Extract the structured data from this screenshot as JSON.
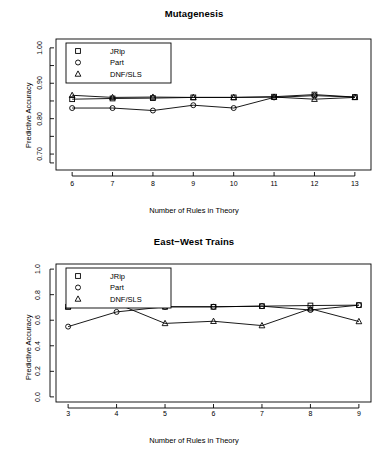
{
  "figure": {
    "axis_label_y": "Predictive Accuracy",
    "axis_label_x": "Number of Rules in Theory",
    "legend": [
      {
        "label": "JRip",
        "marker": "square"
      },
      {
        "label": "Part",
        "marker": "circle"
      },
      {
        "label": "DNF/SLS",
        "marker": "triangle"
      }
    ]
  },
  "chart_data": [
    {
      "type": "line",
      "title": "Mutagenesis",
      "xlabel": "Number of Rules in Theory",
      "ylabel": "Predictive Accuracy",
      "x": [
        6,
        7,
        8,
        9,
        10,
        11,
        12,
        13
      ],
      "xlim": [
        5.6,
        13.4
      ],
      "ylim": [
        0.655,
        1.025
      ],
      "xticks": [
        "6",
        "7",
        "8",
        "9",
        "10",
        "11",
        "12",
        "13"
      ],
      "yticks": [
        "1.00",
        "0.90",
        "0.80",
        "0.70"
      ],
      "ytick_values": [
        1.0,
        0.9,
        0.8,
        0.7
      ],
      "minor_ytick_values": [
        0.95,
        0.85,
        0.75,
        0.675
      ],
      "grid": false,
      "legend_position": "top-left",
      "series": [
        {
          "name": "JRip",
          "marker": "square",
          "values": [
            0.855,
            0.857,
            0.858,
            0.86,
            0.86,
            0.862,
            0.868,
            0.861
          ]
        },
        {
          "name": "Part",
          "marker": "circle",
          "values": [
            0.83,
            0.83,
            0.823,
            0.838,
            0.83,
            0.86,
            0.865,
            0.861
          ]
        },
        {
          "name": "DNF/SLS",
          "marker": "triangle",
          "values": [
            0.866,
            0.86,
            0.861,
            0.86,
            0.86,
            0.861,
            0.855,
            0.86
          ]
        }
      ]
    },
    {
      "type": "line",
      "title": "East−West Trains",
      "xlabel": "Number of Rules in Theory",
      "ylabel": "Predictive Accuracy",
      "x": [
        3,
        4,
        5,
        6,
        7,
        8,
        9
      ],
      "xlim": [
        2.75,
        9.25
      ],
      "ylim": [
        -0.04,
        1.04
      ],
      "xticks": [
        "3",
        "4",
        "5",
        "6",
        "7",
        "8",
        "9"
      ],
      "yticks": [
        "1.0",
        "0.8",
        "0.6",
        "0.4",
        "0.2",
        "0.0"
      ],
      "ytick_values": [
        1.0,
        0.8,
        0.6,
        0.4,
        0.2,
        0.0
      ],
      "minor_ytick_values": [],
      "grid": false,
      "legend_position": "top-left",
      "series": [
        {
          "name": "JRip",
          "marker": "square",
          "values": [
            0.705,
            0.725,
            0.705,
            0.705,
            0.71,
            0.715,
            0.718
          ]
        },
        {
          "name": "Part",
          "marker": "circle",
          "values": [
            0.55,
            0.665,
            0.705,
            0.705,
            0.71,
            0.68,
            0.718
          ]
        },
        {
          "name": "DNF/SLS",
          "marker": "triangle",
          "values": [
            0.705,
            0.73,
            0.575,
            0.592,
            0.558,
            0.69,
            0.59
          ]
        }
      ]
    }
  ]
}
